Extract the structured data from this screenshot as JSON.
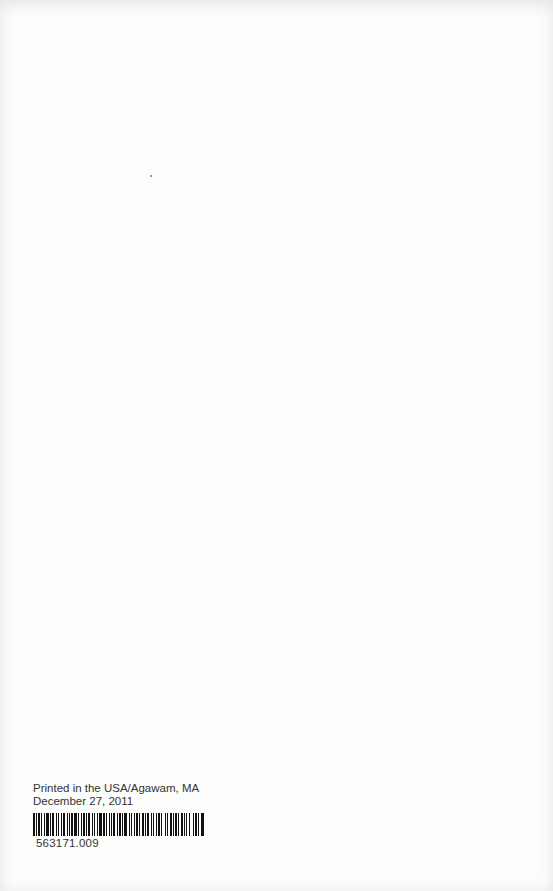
{
  "imprint": {
    "line1": "Printed in the USA/Agawam, MA",
    "line2": "December 27, 2011"
  },
  "barcode": {
    "number": "563171.009",
    "bar_color": "#111111"
  },
  "page": {
    "background": "#fdfdfc"
  }
}
